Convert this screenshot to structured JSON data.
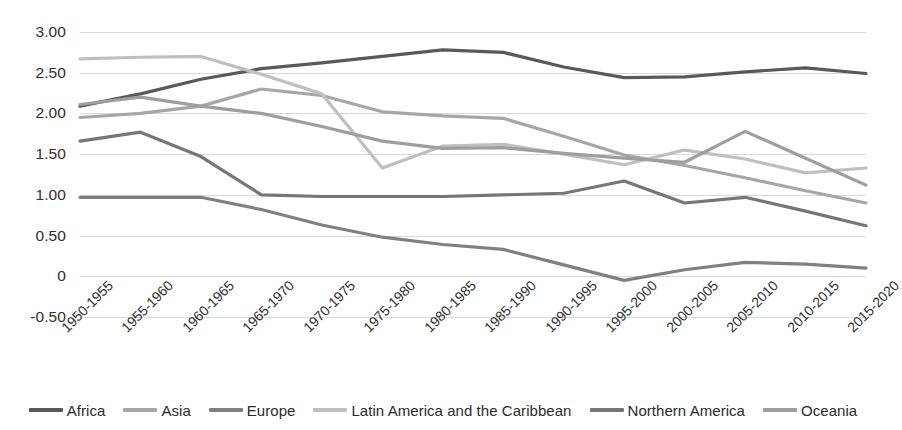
{
  "chart_data": {
    "type": "line",
    "title": "",
    "xlabel": "",
    "ylabel": "",
    "ylim": [
      -0.5,
      3.0
    ],
    "yticks": [
      "3.00",
      "2.50",
      "2.00",
      "1.50",
      "1.00",
      "0.50",
      "0",
      "-0.50"
    ],
    "ytick_values": [
      3.0,
      2.5,
      2.0,
      1.5,
      1.0,
      0.5,
      0,
      -0.5
    ],
    "grid": true,
    "legend_position": "bottom",
    "categories": [
      "1950-1955",
      "1955-1960",
      "1960-1965",
      "1965-1970",
      "1970-1975",
      "1975-1980",
      "1980-1985",
      "1985-1990",
      "1990-1995",
      "1995-2000",
      "2000-2005",
      "2005-2010",
      "2010-2015",
      "2015-2020"
    ],
    "series": [
      {
        "name": "Africa",
        "color": "#595959",
        "values": [
          2.09,
          2.24,
          2.42,
          2.55,
          2.62,
          2.7,
          2.78,
          2.75,
          2.57,
          2.44,
          2.45,
          2.51,
          2.56,
          2.49
        ]
      },
      {
        "name": "Asia",
        "color": "#a6a6a6",
        "values": [
          1.95,
          2.0,
          2.09,
          2.3,
          2.22,
          2.02,
          1.97,
          1.94,
          1.72,
          1.49,
          1.36,
          1.21,
          1.05,
          0.9
        ]
      },
      {
        "name": "Europe",
        "color": "#808080",
        "values": [
          0.97,
          0.97,
          0.97,
          0.82,
          0.63,
          0.48,
          0.39,
          0.33,
          0.14,
          -0.05,
          0.08,
          0.17,
          0.15,
          0.1
        ]
      },
      {
        "name": "Latin America and the Caribbean",
        "color": "#bfbfbf",
        "values": [
          2.67,
          2.69,
          2.7,
          2.48,
          2.24,
          1.33,
          1.6,
          1.62,
          1.5,
          1.37,
          1.55,
          1.44,
          1.27,
          1.33
        ]
      },
      {
        "name": "Northern America",
        "color": "#767676",
        "values": [
          1.66,
          1.77,
          1.47,
          1.0,
          0.98,
          0.98,
          0.98,
          1.0,
          1.02,
          1.17,
          0.9,
          0.97,
          0.8,
          0.62
        ]
      },
      {
        "name": "Oceania",
        "color": "#9e9e9e",
        "values": [
          2.11,
          2.2,
          2.09,
          2.0,
          1.84,
          1.66,
          1.57,
          1.58,
          1.51,
          1.45,
          1.4,
          1.78,
          1.45,
          1.12
        ]
      }
    ]
  }
}
